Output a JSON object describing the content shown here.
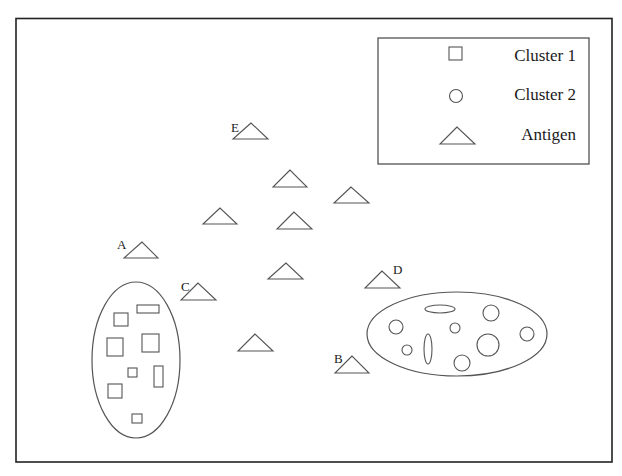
{
  "legend": {
    "items": [
      {
        "label": "Cluster 1",
        "shape": "square"
      },
      {
        "label": "Cluster 2",
        "shape": "circle"
      },
      {
        "label": "Antigen",
        "shape": "triangle"
      }
    ]
  },
  "colors": {
    "stroke": "#555555",
    "frame": "#222222",
    "background": "#ffffff",
    "text": "#1a1a1a"
  },
  "cluster1": {
    "name": "Cluster 1",
    "boundary": {
      "cx": 136,
      "cy": 360,
      "rx": 44,
      "ry": 78
    },
    "members": [
      {
        "x": 114,
        "y": 313,
        "w": 14,
        "h": 13
      },
      {
        "x": 137,
        "y": 305,
        "w": 22,
        "h": 8
      },
      {
        "x": 107,
        "y": 338,
        "w": 16,
        "h": 18
      },
      {
        "x": 142,
        "y": 334,
        "w": 17,
        "h": 18
      },
      {
        "x": 128,
        "y": 368,
        "w": 9,
        "h": 9
      },
      {
        "x": 154,
        "y": 366,
        "w": 9,
        "h": 21
      },
      {
        "x": 108,
        "y": 384,
        "w": 14,
        "h": 14
      },
      {
        "x": 132,
        "y": 414,
        "w": 10,
        "h": 9
      }
    ]
  },
  "cluster2": {
    "name": "Cluster 2",
    "boundary": {
      "cx": 457,
      "cy": 334,
      "rx": 90,
      "ry": 42
    },
    "members": [
      {
        "cx": 440,
        "cy": 309,
        "rx": 15,
        "ry": 4
      },
      {
        "cx": 491,
        "cy": 313,
        "rx": 8,
        "ry": 8
      },
      {
        "cx": 396,
        "cy": 327,
        "rx": 7,
        "ry": 7
      },
      {
        "cx": 455,
        "cy": 328,
        "rx": 5,
        "ry": 5
      },
      {
        "cx": 527,
        "cy": 334,
        "rx": 7,
        "ry": 7
      },
      {
        "cx": 488,
        "cy": 345,
        "rx": 11,
        "ry": 11
      },
      {
        "cx": 407,
        "cy": 350,
        "rx": 5,
        "ry": 5
      },
      {
        "cx": 428,
        "cy": 349,
        "rx": 4,
        "ry": 15
      },
      {
        "cx": 462,
        "cy": 363,
        "rx": 8,
        "ry": 8
      }
    ]
  },
  "antigens": [
    {
      "label": "E",
      "apex": [
        251,
        123
      ],
      "base_y": 139,
      "x1": 233,
      "x2": 268,
      "label_x": 231,
      "label_y": 132
    },
    {
      "label": "",
      "apex": [
        290,
        170
      ],
      "base_y": 187,
      "x1": 273,
      "x2": 307
    },
    {
      "label": "",
      "apex": [
        351,
        187
      ],
      "base_y": 203,
      "x1": 334,
      "x2": 369
    },
    {
      "label": "",
      "apex": [
        220,
        208
      ],
      "base_y": 224,
      "x1": 203,
      "x2": 237
    },
    {
      "label": "",
      "apex": [
        294,
        212
      ],
      "base_y": 229,
      "x1": 277,
      "x2": 312
    },
    {
      "label": "A",
      "apex": [
        142,
        242
      ],
      "base_y": 258,
      "x1": 124,
      "x2": 158,
      "label_x": 117,
      "label_y": 249
    },
    {
      "label": "",
      "apex": [
        286,
        263
      ],
      "base_y": 279,
      "x1": 268,
      "x2": 303
    },
    {
      "label": "C",
      "apex": [
        198,
        283
      ],
      "base_y": 300,
      "x1": 181,
      "x2": 216,
      "label_x": 181,
      "label_y": 291
    },
    {
      "label": "D",
      "apex": [
        382,
        271
      ],
      "base_y": 288,
      "x1": 365,
      "x2": 400,
      "label_x": 393,
      "label_y": 274
    },
    {
      "label": "",
      "apex": [
        255,
        334
      ],
      "base_y": 351,
      "x1": 238,
      "x2": 273
    },
    {
      "label": "B",
      "apex": [
        352,
        356
      ],
      "base_y": 373,
      "x1": 335,
      "x2": 369,
      "label_x": 334,
      "label_y": 363
    }
  ]
}
